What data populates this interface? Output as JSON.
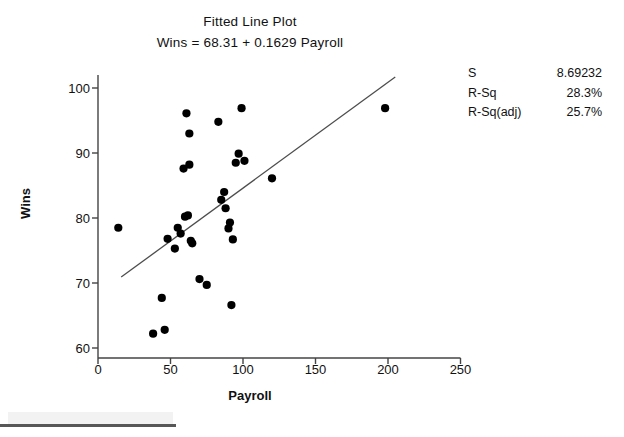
{
  "chart_data": {
    "type": "scatter",
    "title": "Fitted Line Plot",
    "subtitle": "Wins = 68.31 + 0.1629 Payroll",
    "xlabel": "Payroll",
    "ylabel": "Wins",
    "xlim": [
      0,
      250
    ],
    "ylim": [
      58,
      103
    ],
    "xticks": [
      0,
      50,
      100,
      150,
      200,
      250
    ],
    "yticks": [
      60,
      70,
      80,
      90,
      100
    ],
    "grid": false,
    "legend": null,
    "marker_color": "#000000",
    "line_color": "#4d4d4d",
    "fit_line": {
      "intercept": 68.31,
      "slope": 0.1629,
      "x_start": 16,
      "x_end": 205
    },
    "points": [
      {
        "x": 14,
        "y": 78.5
      },
      {
        "x": 38,
        "y": 62.2
      },
      {
        "x": 44,
        "y": 67.7
      },
      {
        "x": 46,
        "y": 62.8
      },
      {
        "x": 48,
        "y": 76.8
      },
      {
        "x": 53,
        "y": 75.3
      },
      {
        "x": 55,
        "y": 78.5
      },
      {
        "x": 57,
        "y": 77.6
      },
      {
        "x": 59,
        "y": 87.6
      },
      {
        "x": 60,
        "y": 80.2
      },
      {
        "x": 61,
        "y": 96.1
      },
      {
        "x": 62,
        "y": 80.4
      },
      {
        "x": 63,
        "y": 88.2
      },
      {
        "x": 63,
        "y": 93.0
      },
      {
        "x": 64,
        "y": 76.5
      },
      {
        "x": 65,
        "y": 76.1
      },
      {
        "x": 70,
        "y": 70.6
      },
      {
        "x": 75,
        "y": 69.7
      },
      {
        "x": 83,
        "y": 94.8
      },
      {
        "x": 85,
        "y": 82.8
      },
      {
        "x": 87,
        "y": 84.0
      },
      {
        "x": 88,
        "y": 81.5
      },
      {
        "x": 90,
        "y": 78.4
      },
      {
        "x": 91,
        "y": 79.3
      },
      {
        "x": 92,
        "y": 66.6
      },
      {
        "x": 93,
        "y": 76.7
      },
      {
        "x": 95,
        "y": 88.5
      },
      {
        "x": 97,
        "y": 89.9
      },
      {
        "x": 99,
        "y": 96.9
      },
      {
        "x": 101,
        "y": 88.8
      },
      {
        "x": 120,
        "y": 86.1
      },
      {
        "x": 198,
        "y": 96.9
      }
    ],
    "stats": [
      {
        "label": "S",
        "value": "8.69232"
      },
      {
        "label": "R-Sq",
        "value": "28.3%"
      },
      {
        "label": "R-Sq(adj)",
        "value": "25.7%"
      }
    ]
  }
}
